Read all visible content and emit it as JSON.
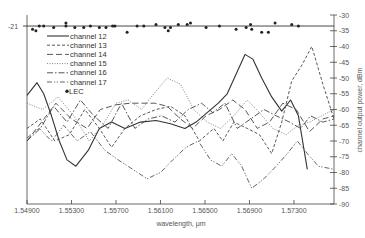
{
  "chart_data": {
    "type": "line",
    "title": "",
    "xlabel": "wavelength, μm",
    "ylabel": "channel output power, dBm",
    "xlim": [
      1.549,
      1.5766
    ],
    "ylim": [
      -90,
      -30
    ],
    "x_ticks": [
      "1.54900",
      "1.55300",
      "1.55700",
      "1.56100",
      "1.56500",
      "1.56900",
      "1.57300"
    ],
    "x_tick_values": [
      1.549,
      1.553,
      1.557,
      1.561,
      1.565,
      1.569,
      1.573
    ],
    "y_ticks": [
      "-30",
      "-35",
      "-40",
      "-45",
      "-50",
      "-55",
      "-60",
      "-65",
      "-70",
      "-75",
      "-80",
      "-85",
      "-90"
    ],
    "y_tick_values": [
      -30,
      -35,
      -40,
      -45,
      -50,
      -55,
      -60,
      -65,
      -70,
      -75,
      -80,
      -85,
      -90
    ],
    "left_annotation": "-21",
    "legend_position": "top-left",
    "grid": false,
    "series": [
      {
        "name": "channel 12",
        "style": "solid",
        "x": [
          1.549,
          1.5499,
          1.5505,
          1.5512,
          1.5519,
          1.5526,
          1.5534,
          1.5545,
          1.5555,
          1.5566,
          1.5578,
          1.5592,
          1.5606,
          1.5619,
          1.5632,
          1.5642,
          1.5652,
          1.5662,
          1.567,
          1.5679,
          1.5686,
          1.5693,
          1.5701,
          1.571,
          1.5719,
          1.5727,
          1.5734,
          1.5742
        ],
        "y": [
          -55.5,
          -51.5,
          -55,
          -62,
          -70,
          -76,
          -78,
          -73,
          -66,
          -64,
          -66,
          -64,
          -63.5,
          -64.5,
          -66,
          -64,
          -61,
          -58,
          -55,
          -48,
          -42.5,
          -44,
          -50,
          -56,
          -60.5,
          -57,
          -62,
          -79
        ]
      },
      {
        "name": "channel 13",
        "style": "dashed",
        "x": [
          1.549,
          1.5502,
          1.5515,
          1.5528,
          1.5542,
          1.5555,
          1.5566,
          1.5578,
          1.5592,
          1.5606,
          1.5619,
          1.5632,
          1.5645,
          1.5658,
          1.5666,
          1.5676,
          1.5688,
          1.5699,
          1.571,
          1.5719,
          1.5728,
          1.5737,
          1.5746,
          1.5756,
          1.5766
        ],
        "y": [
          -66,
          -63,
          -70,
          -68,
          -60,
          -66,
          -72,
          -66,
          -62,
          -60,
          -59,
          -62,
          -70,
          -66,
          -70,
          -64,
          -66,
          -68,
          -74,
          -64,
          -51,
          -46,
          -40,
          -52,
          -63
        ]
      },
      {
        "name": "channel 14",
        "style": "long-dash",
        "x": [
          1.549,
          1.5503,
          1.5516,
          1.553,
          1.5544,
          1.5556,
          1.557,
          1.5583,
          1.5594,
          1.5605,
          1.5616,
          1.5628,
          1.5639,
          1.5651,
          1.5663,
          1.5675,
          1.5686,
          1.5697,
          1.5708,
          1.572,
          1.5732,
          1.5744,
          1.5756,
          1.5766
        ],
        "y": [
          -70,
          -64,
          -58,
          -63,
          -66,
          -60,
          -58.5,
          -58,
          -58,
          -58,
          -59,
          -63,
          -66,
          -62,
          -60,
          -57,
          -60,
          -66,
          -64,
          -58,
          -60,
          -67,
          -63,
          -62
        ]
      },
      {
        "name": "channel 15",
        "style": "dotted",
        "x": [
          1.549,
          1.5504,
          1.5518,
          1.5532,
          1.5546,
          1.5558,
          1.557,
          1.5581,
          1.5593,
          1.5604,
          1.5616,
          1.5628,
          1.564,
          1.5652,
          1.5664,
          1.5676,
          1.5688,
          1.5699,
          1.5711,
          1.5723,
          1.5734,
          1.5744,
          1.5755,
          1.5766
        ],
        "y": [
          -58,
          -60,
          -56,
          -62,
          -70,
          -65,
          -58,
          -57,
          -60,
          -55,
          -50,
          -52,
          -60,
          -64,
          -66,
          -62,
          -57,
          -61,
          -66,
          -68,
          -65,
          -64,
          -62,
          -60
        ]
      },
      {
        "name": "channel 16",
        "style": "dash-dot",
        "x": [
          1.549,
          1.5502,
          1.5514,
          1.5526,
          1.5538,
          1.555,
          1.5563,
          1.5575,
          1.5587,
          1.5599,
          1.5611,
          1.5623,
          1.5635,
          1.5647,
          1.5657,
          1.5668,
          1.5679,
          1.5691,
          1.5703,
          1.5714,
          1.5726,
          1.5736,
          1.5745,
          1.5756,
          1.5766
        ],
        "y": [
          -70,
          -66,
          -59,
          -64,
          -57,
          -62,
          -66,
          -58,
          -66,
          -63,
          -62,
          -64,
          -60,
          -58,
          -61,
          -58,
          -66,
          -63,
          -60,
          -62,
          -64,
          -66,
          -62,
          -64,
          -63
        ]
      },
      {
        "name": "channel 17",
        "style": "dash-dot-dot",
        "x": [
          1.549,
          1.5501,
          1.5512,
          1.5523,
          1.5535,
          1.5547,
          1.556,
          1.5572,
          1.5585,
          1.5598,
          1.561,
          1.5621,
          1.5633,
          1.5644,
          1.5655,
          1.5665,
          1.5674,
          1.5683,
          1.5692,
          1.5703,
          1.5714,
          1.5724,
          1.5733,
          1.5742,
          1.5752,
          1.5766
        ],
        "y": [
          -69,
          -66,
          -70,
          -65,
          -70,
          -67,
          -73,
          -76,
          -79,
          -82,
          -80,
          -76,
          -72,
          -70,
          -76,
          -78,
          -74,
          -78,
          -85,
          -82,
          -78,
          -74,
          -70,
          -74,
          -78,
          -79
        ]
      }
    ],
    "lec_points": {
      "name": "LEC",
      "style": "markers",
      "x": [
        1.5495,
        1.5498,
        1.5501,
        1.5505,
        1.5514,
        1.5525,
        1.5525,
        1.5533,
        1.5541,
        1.5547,
        1.5555,
        1.5561,
        1.5567,
        1.5569,
        1.558,
        1.5589,
        1.5595,
        1.5606,
        1.5614,
        1.5617,
        1.5619,
        1.5626,
        1.5634,
        1.5637,
        1.5651,
        1.5663,
        1.5678,
        1.5687,
        1.5691,
        1.5692,
        1.5701,
        1.5707,
        1.5713,
        1.5728,
        1.5734
      ],
      "y": [
        -34.5,
        -35,
        -33.5,
        -33.5,
        -34,
        -32.5,
        -33.5,
        -34,
        -34,
        -33.5,
        -34,
        -34,
        -33.5,
        -33.5,
        -35.5,
        -33.5,
        -33.5,
        -33,
        -34,
        -35,
        -34,
        -33,
        -33,
        -32.5,
        -34,
        -33.5,
        -34.5,
        -34,
        -33,
        -34.5,
        -35.5,
        -35.5,
        -32.5,
        -33,
        -33.5
      ],
      "reference_line": -33.5
    }
  }
}
